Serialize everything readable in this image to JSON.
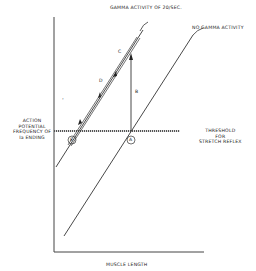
{
  "diagram": {
    "y_axis_label": [
      "ACTION",
      "POTENTIAL",
      "FREQUENCY OF",
      "Ia ENDING"
    ],
    "x_axis_label": "MUSCLE LENGTH",
    "threshold_label": [
      "THRESHOLD",
      "FOR",
      "STRETCH REFLEX"
    ],
    "lines": {
      "gamma": "GAMMA ACTIVITY OF 20/SEC.",
      "no_gamma": "NO GAMMA ACTIVITY"
    },
    "points": {
      "a": "A",
      "b": "B",
      "c": "C",
      "d": "D",
      "e": "E"
    },
    "stray_mark": "•"
  }
}
